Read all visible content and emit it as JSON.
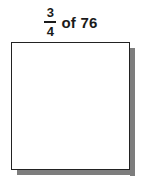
{
  "problem": {
    "fraction": {
      "numerator": "3",
      "denominator": "4"
    },
    "operator_text": "of 76",
    "whole_number": "76",
    "full_text": "3/4 of 76"
  },
  "answer_box": {
    "content": "",
    "border_color": "#222222",
    "shadow_color": "#7d7d7d",
    "fill_color": "#ffffff"
  },
  "colors": {
    "text": "#1a1a1a",
    "background": "#ffffff"
  }
}
